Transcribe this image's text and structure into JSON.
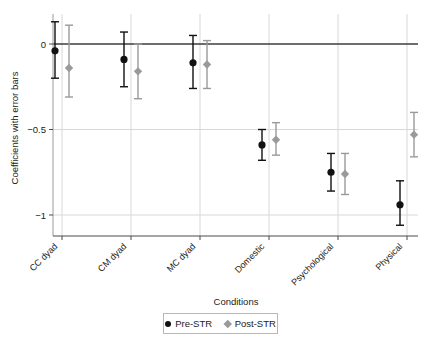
{
  "chart_data": {
    "type": "scatter",
    "title": "",
    "xlabel": "Conditions",
    "ylabel": "Coefficients with error bars",
    "categories": [
      "CC dyad",
      "CM dyad",
      "MC dyad",
      "Domestic",
      "Psychological",
      "Physical"
    ],
    "ylim": [
      -1.12,
      0.18
    ],
    "yticks": [
      0,
      -0.5,
      -1
    ],
    "ytick_labels": [
      "0",
      "−0.5",
      "−1"
    ],
    "grid": "horizontal-and-vertical-light",
    "legend_position": "bottom-center",
    "reference_line": 0,
    "series": [
      {
        "name": "Pre-STR",
        "marker": "circle",
        "color": "#111111",
        "values": [
          -0.04,
          -0.09,
          -0.11,
          -0.59,
          -0.75,
          -0.94
        ],
        "err_low": [
          -0.2,
          -0.25,
          -0.26,
          -0.68,
          -0.86,
          -1.06
        ],
        "err_high": [
          0.13,
          0.07,
          0.05,
          -0.5,
          -0.64,
          -0.8
        ]
      },
      {
        "name": "Post-STR",
        "marker": "diamond",
        "color": "#9a9a9a",
        "values": [
          -0.14,
          -0.16,
          -0.12,
          -0.56,
          -0.76,
          -0.53
        ],
        "err_low": [
          -0.31,
          -0.32,
          -0.26,
          -0.65,
          -0.88,
          -0.66
        ],
        "err_high": [
          0.11,
          0.0,
          0.02,
          -0.46,
          -0.64,
          -0.4
        ]
      }
    ]
  },
  "legend": {
    "items": [
      {
        "label": "Pre-STR",
        "marker": "circle"
      },
      {
        "label": "Post-STR",
        "marker": "diamond"
      }
    ]
  },
  "colors": {
    "pre": "#111111",
    "post": "#9a9a9a",
    "axis": "#4a4a4a",
    "grid": "#d8d8d8",
    "background": "#ffffff"
  }
}
